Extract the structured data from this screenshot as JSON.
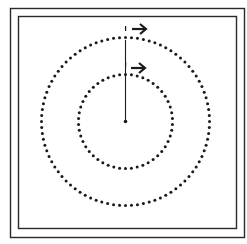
{
  "diagram": {
    "colors": {
      "background": "#ffffff",
      "ink": "#1a1a1a",
      "frame": "#2a2a2a"
    },
    "circles": [
      {
        "name": "outer-circle",
        "style": "dotted",
        "relative_radius": 1.0,
        "dot_count": 88
      },
      {
        "name": "inner-circle",
        "style": "dotted",
        "relative_radius": 0.56,
        "dot_count": 50
      }
    ],
    "arrows": [
      {
        "name": "outer-arrow",
        "direction": "right",
        "on": "outer-circle"
      },
      {
        "name": "inner-arrow",
        "direction": "right",
        "on": "inner-circle"
      }
    ],
    "radius_line": {
      "from": "center",
      "to": "outer-circle-top"
    },
    "icons": {
      "arrow": "arrow-right-icon",
      "center": "center-point-icon"
    }
  }
}
